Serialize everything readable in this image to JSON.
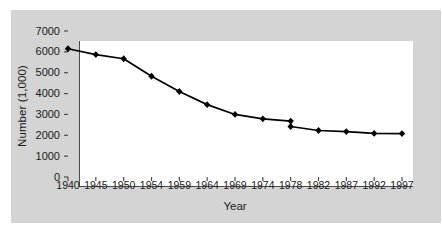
{
  "figure": {
    "background_color": "#ffffff",
    "panel_color": "#d4d4d4",
    "plot_background": "#ffffff",
    "axis_color": "#4a4a4a",
    "series_color": "#000000"
  },
  "chart_data": {
    "type": "line",
    "title": "",
    "xlabel": "Year",
    "ylabel": "Number (1,000)",
    "categories": [
      "1940",
      "1945",
      "1950",
      "1954",
      "1959",
      "1964",
      "1969",
      "1974",
      "1978",
      "1982",
      "1987",
      "1992",
      "1997"
    ],
    "values": [
      6150,
      5870,
      5670,
      4830,
      4100,
      3470,
      3000,
      2790,
      2680,
      2230,
      2180,
      2090,
      2080
    ],
    "discontinuity": {
      "at_category": "1978",
      "upper_value": 2680,
      "lower_value": 2420,
      "note": "break in series at 1978"
    },
    "ylim": [
      0,
      7000
    ],
    "yticks": [
      0,
      1000,
      2000,
      3000,
      4000,
      5000,
      6000,
      7000
    ],
    "ytick_labels": [
      "0",
      "1000",
      "2000",
      "3000",
      "4000",
      "5000",
      "6000",
      "7000"
    ],
    "xtick_labels": [
      "1940",
      "1945",
      "1950",
      "1954",
      "1959",
      "1964",
      "1969",
      "1974",
      "1978",
      "1982",
      "1987",
      "1992",
      "1997"
    ],
    "grid": false,
    "legend": null,
    "marker": "diamond",
    "series": [
      {
        "name": "Number (1,000)",
        "values": [
          6150,
          5870,
          5670,
          4830,
          4100,
          3470,
          3000,
          2790,
          2680,
          2230,
          2180,
          2090,
          2080
        ]
      }
    ]
  }
}
